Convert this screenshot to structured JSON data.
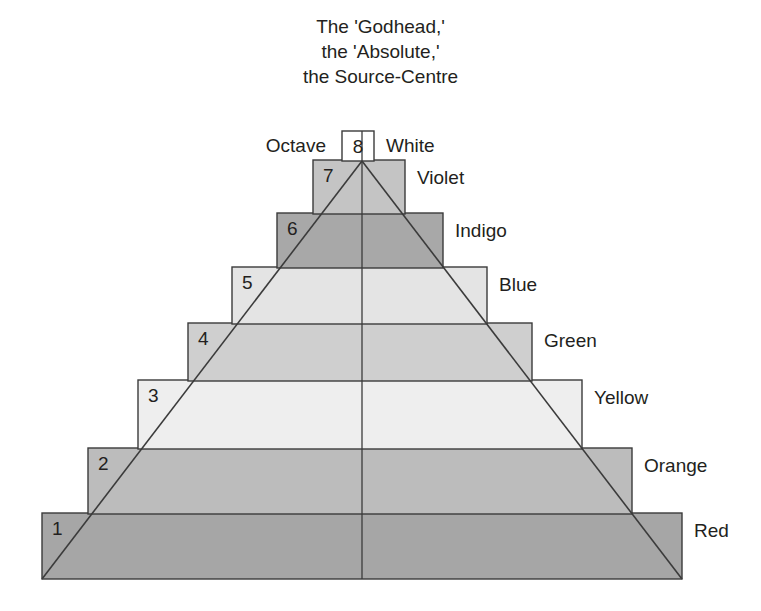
{
  "title": {
    "line1": "The 'Godhead,'",
    "line2": "the 'Absolute,'",
    "line3": "the Source-Centre"
  },
  "apex": {
    "number": "8",
    "left_label": "Octave",
    "right_label": "White",
    "fill": "#ffffff"
  },
  "chart_data": {
    "type": "pyramid-diagram",
    "title": "The 'Godhead,' the 'Absolute,' the Source-Centre",
    "levels": [
      {
        "number": "8",
        "label": "White",
        "fill": "#ffffff",
        "x": 342,
        "y": 131,
        "width": 32,
        "height": 30
      },
      {
        "number": "7",
        "label": "Violet",
        "fill": "#c4c4c4",
        "x": 313,
        "y": 160,
        "width": 92,
        "height": 54
      },
      {
        "number": "6",
        "label": "Indigo",
        "fill": "#a8a8a8",
        "x": 277,
        "y": 213,
        "width": 166,
        "height": 55
      },
      {
        "number": "5",
        "label": "Blue",
        "fill": "#e4e4e4",
        "x": 232,
        "y": 267,
        "width": 255,
        "height": 57
      },
      {
        "number": "4",
        "label": "Green",
        "fill": "#cfcfcf",
        "x": 188,
        "y": 323,
        "width": 344,
        "height": 58
      },
      {
        "number": "3",
        "label": "Yellow",
        "fill": "#eeeeee",
        "x": 138,
        "y": 380,
        "width": 444,
        "height": 69
      },
      {
        "number": "2",
        "label": "Orange",
        "fill": "#bcbcbc",
        "x": 88,
        "y": 448,
        "width": 544,
        "height": 66
      },
      {
        "number": "1",
        "label": "Red",
        "fill": "#a6a6a6",
        "x": 42,
        "y": 513,
        "width": 640,
        "height": 66
      }
    ],
    "apex_point": {
      "x": 362,
      "y": 161
    },
    "base_left": {
      "x": 42,
      "y": 579
    },
    "base_right": {
      "x": 682,
      "y": 579
    },
    "center_line": {
      "x": 362,
      "y_top": 131,
      "y_bottom": 579
    },
    "stroke_color": "#3b3b3b"
  }
}
